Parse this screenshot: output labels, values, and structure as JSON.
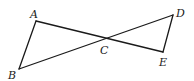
{
  "diagram": {
    "type": "geometry",
    "points": {
      "A": {
        "x": 36,
        "y": 21
      },
      "B": {
        "x": 19,
        "y": 69
      },
      "C": {
        "x": 104,
        "y": 39
      },
      "D": {
        "x": 173,
        "y": 15
      },
      "E": {
        "x": 163,
        "y": 52
      }
    },
    "segments": [
      {
        "from": "A",
        "to": "B"
      },
      {
        "from": "A",
        "to": "E"
      },
      {
        "from": "B",
        "to": "D"
      },
      {
        "from": "D",
        "to": "E"
      }
    ],
    "labels": [
      {
        "text": "A",
        "x": 30,
        "y": 18
      },
      {
        "text": "B",
        "x": 8,
        "y": 79
      },
      {
        "text": "C",
        "x": 100,
        "y": 54
      },
      {
        "text": "D",
        "x": 176,
        "y": 17
      },
      {
        "text": "E",
        "x": 159,
        "y": 66
      }
    ]
  }
}
